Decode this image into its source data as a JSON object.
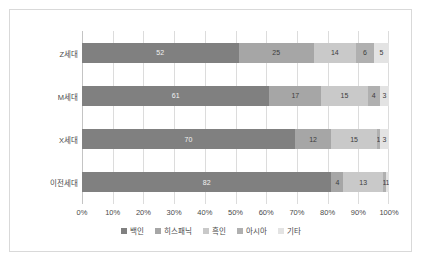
{
  "chart_data": {
    "type": "bar",
    "subtype": "100% stacked horizontal bar",
    "title": "",
    "xlabel": "",
    "ylabel": "",
    "categories": [
      "Z세대",
      "M세대",
      "X세대",
      "이전세대"
    ],
    "series": [
      {
        "name": "백인",
        "color": "#808080",
        "values": [
          52,
          61,
          70,
          82
        ]
      },
      {
        "name": "히스패닉",
        "color": "#a6a6a6",
        "values": [
          25,
          17,
          12,
          4
        ]
      },
      {
        "name": "흑인",
        "color": "#c9c9c9",
        "values": [
          14,
          15,
          15,
          13
        ]
      },
      {
        "name": "아시아",
        "color": "#b0b0b0",
        "values": [
          6,
          4,
          1,
          1
        ]
      },
      {
        "name": "기타",
        "color": "#e3e3e3",
        "values": [
          5,
          3,
          3,
          1
        ]
      }
    ],
    "xticks": [
      "0%",
      "10%",
      "20%",
      "30%",
      "40%",
      "50%",
      "60%",
      "70%",
      "80%",
      "90%",
      "100%"
    ],
    "xlim": [
      0,
      100
    ],
    "grid": true,
    "legend_position": "bottom",
    "frame_border_color": "#d9d9d9",
    "gridline_color": "#dcdcdc"
  }
}
